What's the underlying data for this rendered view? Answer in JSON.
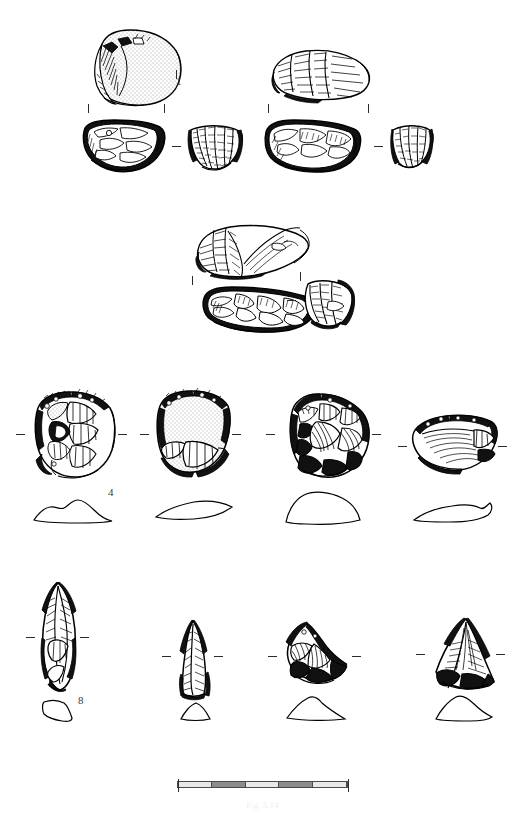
{
  "figure": {
    "kind": "archaeological-lithic-plate",
    "background_color": "#ffffff",
    "ink_color": "#000000",
    "width": 524,
    "height": 817,
    "caption": "Fig. 3.14"
  },
  "item_numbers": [
    {
      "label": "1",
      "x": 176,
      "y": 76
    },
    {
      "label": "4",
      "x": 108,
      "y": 487
    },
    {
      "label": "8",
      "x": 78,
      "y": 695
    }
  ],
  "scale": {
    "x": 177,
    "y": 781,
    "width": 171,
    "segments": [
      "light",
      "dark",
      "light",
      "dark",
      "light"
    ],
    "caption": "Fig. 3.14"
  },
  "rows": [
    {
      "name": "row-1-cores",
      "artifacts": [
        {
          "name": "core-1-dorsal-view",
          "x": 88,
          "y": 26,
          "w": 98,
          "h": 82
        },
        {
          "name": "core-2-dorsal-view",
          "x": 268,
          "y": 48,
          "w": 105,
          "h": 55
        },
        {
          "name": "core-1-section-view",
          "x": 80,
          "y": 118,
          "w": 86,
          "h": 55
        },
        {
          "name": "core-1-end-view",
          "x": 187,
          "y": 124,
          "w": 56,
          "h": 48
        },
        {
          "name": "core-2-section-view",
          "x": 262,
          "y": 118,
          "w": 100,
          "h": 56
        },
        {
          "name": "core-2-end-view",
          "x": 390,
          "y": 124,
          "w": 43,
          "h": 45
        }
      ],
      "ticks": [
        {
          "orientation": "vertical",
          "x": 88,
          "y": 104
        },
        {
          "orientation": "vertical",
          "x": 164,
          "y": 104
        },
        {
          "orientation": "vertical",
          "x": 176,
          "y": 70
        },
        {
          "orientation": "vertical",
          "x": 268,
          "y": 104
        },
        {
          "orientation": "vertical",
          "x": 368,
          "y": 104
        },
        {
          "orientation": "horizontal",
          "x": 172,
          "y": 146
        },
        {
          "orientation": "horizontal",
          "x": 374,
          "y": 146
        }
      ]
    },
    {
      "name": "row-2-cores",
      "artifacts": [
        {
          "name": "core-3-dorsal-view",
          "x": 192,
          "y": 222,
          "w": 118,
          "h": 60
        },
        {
          "name": "core-3-section-view",
          "x": 200,
          "y": 284,
          "w": 118,
          "h": 50
        },
        {
          "name": "core-3-end-view",
          "x": 298,
          "y": 278,
          "w": 55,
          "h": 50
        }
      ],
      "ticks": [
        {
          "orientation": "vertical",
          "x": 192,
          "y": 276
        },
        {
          "orientation": "vertical",
          "x": 300,
          "y": 272
        },
        {
          "orientation": "horizontal",
          "x": 287,
          "y": 300
        }
      ]
    },
    {
      "name": "row-3-scrapers",
      "artifacts": [
        {
          "name": "scraper-4-plan-view",
          "x": 28,
          "y": 388,
          "w": 88,
          "h": 90
        },
        {
          "name": "scraper-5-plan-view",
          "x": 152,
          "y": 388,
          "w": 78,
          "h": 88
        },
        {
          "name": "scraper-6-plan-view",
          "x": 278,
          "y": 390,
          "w": 92,
          "h": 92
        },
        {
          "name": "scraper-7-plan-view",
          "x": 408,
          "y": 410,
          "w": 88,
          "h": 62
        }
      ],
      "profiles": [
        {
          "name": "scraper-4-profile",
          "x": 32,
          "y": 496,
          "w": 82,
          "h": 26
        },
        {
          "name": "scraper-5-profile",
          "x": 154,
          "y": 498,
          "w": 80,
          "h": 22
        },
        {
          "name": "scraper-6-profile",
          "x": 282,
          "y": 490,
          "w": 82,
          "h": 34
        },
        {
          "name": "scraper-7-profile",
          "x": 412,
          "y": 500,
          "w": 82,
          "h": 22
        }
      ],
      "ticks": [
        {
          "orientation": "horizontal",
          "x": 16,
          "y": 434
        },
        {
          "orientation": "horizontal",
          "x": 118,
          "y": 434
        },
        {
          "orientation": "horizontal",
          "x": 140,
          "y": 434
        },
        {
          "orientation": "horizontal",
          "x": 232,
          "y": 434
        },
        {
          "orientation": "horizontal",
          "x": 266,
          "y": 434
        },
        {
          "orientation": "horizontal",
          "x": 372,
          "y": 434
        },
        {
          "orientation": "horizontal",
          "x": 398,
          "y": 446
        },
        {
          "orientation": "horizontal",
          "x": 498,
          "y": 446
        }
      ]
    },
    {
      "name": "row-4-points",
      "artifacts": [
        {
          "name": "point-8-plan-view",
          "x": 38,
          "y": 580,
          "w": 40,
          "h": 110
        },
        {
          "name": "point-9-plan-view",
          "x": 176,
          "y": 618,
          "w": 34,
          "h": 78
        },
        {
          "name": "point-10-plan-view",
          "x": 282,
          "y": 620,
          "w": 66,
          "h": 66
        },
        {
          "name": "point-11-plan-view",
          "x": 430,
          "y": 616,
          "w": 62,
          "h": 74
        }
      ],
      "profiles": [
        {
          "name": "point-8-profile",
          "x": 40,
          "y": 698,
          "w": 38,
          "h": 24
        },
        {
          "name": "point-9-profile",
          "x": 178,
          "y": 700,
          "w": 34,
          "h": 20
        },
        {
          "name": "point-10-profile",
          "x": 284,
          "y": 694,
          "w": 62,
          "h": 26
        },
        {
          "name": "point-11-profile",
          "x": 432,
          "y": 694,
          "w": 60,
          "h": 26
        }
      ],
      "ticks": [
        {
          "orientation": "horizontal",
          "x": 26,
          "y": 637
        },
        {
          "orientation": "horizontal",
          "x": 80,
          "y": 637
        },
        {
          "orientation": "horizontal",
          "x": 162,
          "y": 656
        },
        {
          "orientation": "horizontal",
          "x": 214,
          "y": 656
        },
        {
          "orientation": "horizontal",
          "x": 268,
          "y": 656
        },
        {
          "orientation": "horizontal",
          "x": 352,
          "y": 656
        },
        {
          "orientation": "horizontal",
          "x": 416,
          "y": 654
        },
        {
          "orientation": "horizontal",
          "x": 496,
          "y": 654
        }
      ]
    }
  ]
}
